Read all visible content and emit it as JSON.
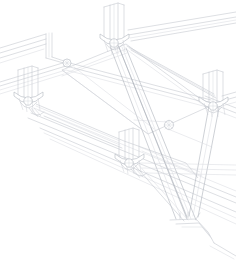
{
  "document": {
    "title": "Structural Axonometric Wireframe",
    "drawing_type": "axonometric-line-drawing",
    "subject": "space-frame truss node assembly with diagonal bracing",
    "background_color": "#ffffff",
    "line_color": "#c6c9d0",
    "line_color_accent": "#adb1ba",
    "line_weight": 0.6,
    "canvas": {
      "width": 236,
      "height": 261
    }
  },
  "nodes": [
    {
      "id": "node-top-apex",
      "label": "Top apex connector",
      "x": 114,
      "y": 38,
      "size": "large"
    },
    {
      "id": "node-left-main",
      "label": "Left main connector",
      "x": 28,
      "y": 96,
      "size": "large"
    },
    {
      "id": "node-right-main",
      "label": "Right main connector",
      "x": 213,
      "y": 101,
      "size": "large"
    },
    {
      "id": "node-lower-center",
      "label": "Lower center connector",
      "x": 129,
      "y": 158,
      "size": "large"
    },
    {
      "id": "node-upper-left-cross",
      "label": "Upper left cross hub",
      "x": 67,
      "y": 64,
      "size": "small"
    },
    {
      "id": "node-mid-right-cross",
      "label": "Mid right cross hub",
      "x": 169,
      "y": 125,
      "size": "small"
    },
    {
      "id": "node-brace-foot",
      "label": "Diagonal brace foot joint",
      "x": 186,
      "y": 222,
      "size": "joint"
    }
  ],
  "members": [
    {
      "id": "beam-top-rail",
      "label": "Upper horizontal rail",
      "kind": "beam"
    },
    {
      "id": "beam-front-rail",
      "label": "Front horizontal rail",
      "kind": "beam"
    },
    {
      "id": "beam-lower-rail",
      "label": "Lower horizontal rail",
      "kind": "beam"
    },
    {
      "id": "beam-left-spur",
      "label": "Left spur beam",
      "kind": "beam"
    },
    {
      "id": "beam-right-spur",
      "label": "Right spur beam",
      "kind": "beam"
    },
    {
      "id": "post-top",
      "label": "Top vertical post",
      "kind": "post"
    },
    {
      "id": "post-left",
      "label": "Left vertical post",
      "kind": "post"
    },
    {
      "id": "post-right",
      "label": "Right vertical post",
      "kind": "post"
    },
    {
      "id": "post-center",
      "label": "Center vertical post",
      "kind": "post"
    },
    {
      "id": "brace-apex-long",
      "label": "Long diagonal brace from apex",
      "kind": "brace"
    },
    {
      "id": "brace-apex-short",
      "label": "Second diagonal brace from apex",
      "kind": "brace"
    },
    {
      "id": "brace-right-vertical",
      "label": "Right descending brace",
      "kind": "brace"
    },
    {
      "id": "brace-center-tie",
      "label": "Center tie brace",
      "kind": "brace"
    }
  ],
  "panels": [
    {
      "id": "panel-upper-deck",
      "label": "Upper deck panel"
    },
    {
      "id": "panel-mid-deck",
      "label": "Mid deck panel"
    }
  ]
}
